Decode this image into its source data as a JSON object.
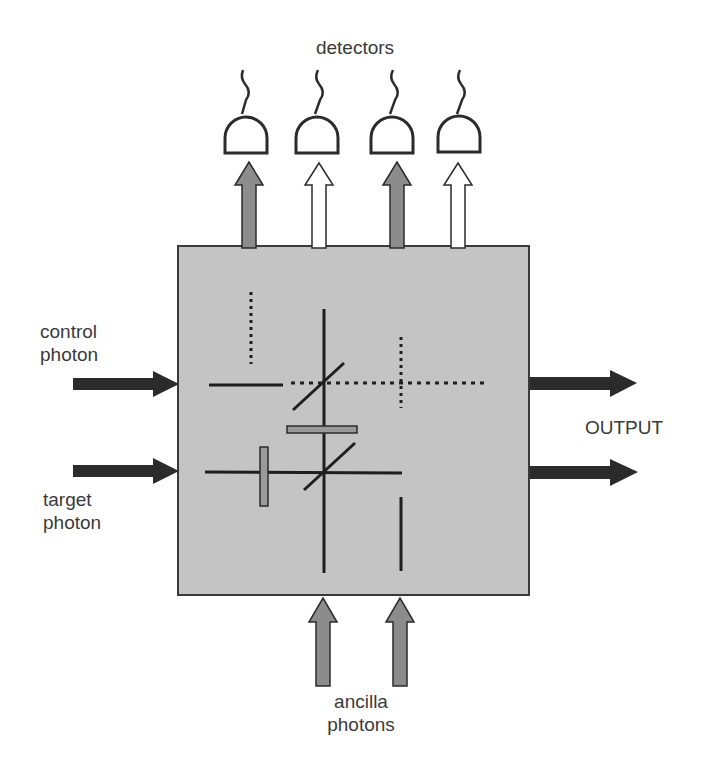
{
  "labels": {
    "detectors": "detectors",
    "control_line1": "control",
    "control_line2": "photon",
    "target_line1": "target",
    "target_line2": "photon",
    "output": "OUTPUT",
    "ancilla_line1": "ancilla",
    "ancilla_line2": "photons"
  },
  "colors": {
    "box_fill": "#c4c4c4",
    "box_stroke": "#3a3a3a",
    "arrow_dark": "#2b2b2b",
    "arrow_gray": "#8c8c8c",
    "arrow_white": "#ffffff",
    "line": "#1e1e1e",
    "plate_fill": "#9a9a9a"
  },
  "detectors": [
    {
      "x": 247,
      "arrow": "gray"
    },
    {
      "x": 316,
      "arrow": "white"
    },
    {
      "x": 394,
      "arrow": "gray"
    },
    {
      "x": 460,
      "arrow": "white"
    }
  ],
  "inputs": [
    "control photon",
    "target photon"
  ],
  "outputs": 2,
  "ancilla_inputs": 2
}
